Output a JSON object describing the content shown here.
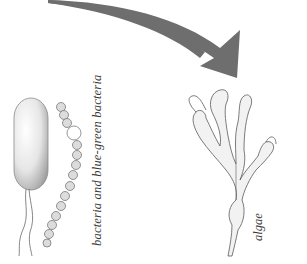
{
  "figure": {
    "arrow": {
      "label": "arrow",
      "color": "#6e6e6e",
      "direction": "left-to-right-down"
    },
    "left_illustration": {
      "subject": "bacteria and blue-green bacteria",
      "caption": "bacteria and blue-green bacteria"
    },
    "right_illustration": {
      "subject": "algae",
      "caption": "algae"
    },
    "colors": {
      "background": "#ffffff",
      "arrow": "#6e6e6e",
      "ink": "#5a5a5a",
      "caption": "#3a3a3a"
    }
  }
}
